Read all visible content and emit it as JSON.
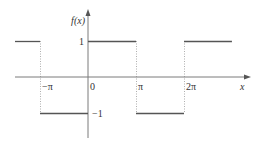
{
  "chart_data": {
    "type": "line",
    "title": "",
    "xlabel": "x",
    "ylabel": "f(x)",
    "xlim": [
      -4.0,
      5.0
    ],
    "ylim": [
      -1.5,
      1.5
    ],
    "grid": false,
    "x_ticks": [
      {
        "value": -3.14159,
        "label": "−π"
      },
      {
        "value": 0,
        "label": "0"
      },
      {
        "value": 3.14159,
        "label": "π"
      },
      {
        "value": 6.28319,
        "label": "2π"
      }
    ],
    "y_ticks": [
      {
        "value": 1,
        "label": "1"
      },
      {
        "value": -1,
        "label": "−1"
      }
    ],
    "series": [
      {
        "name": "square wave f(x)",
        "segments": [
          {
            "x": [
              -5.03,
              -3.14159
            ],
            "y": 1
          },
          {
            "x": [
              -3.14159,
              0
            ],
            "y": -1
          },
          {
            "x": [
              0,
              3.14159
            ],
            "y": 1
          },
          {
            "x": [
              3.14159,
              6.28319
            ],
            "y": -1
          },
          {
            "x": [
              6.28319,
              9.42
            ],
            "y": 1
          }
        ]
      }
    ],
    "discontinuity_guides": [
      -3.14159,
      3.14159,
      6.28319
    ]
  }
}
